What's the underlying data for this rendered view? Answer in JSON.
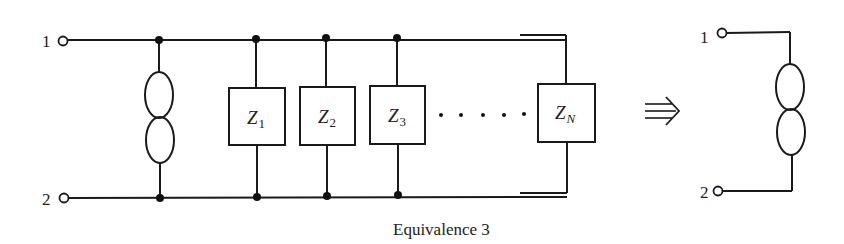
{
  "diagram": {
    "type": "circuit-equivalence",
    "caption": "Equivalence 3",
    "equivalence_arrow": "⇛",
    "left_circuit": {
      "terminals": [
        {
          "label": "1"
        },
        {
          "label": "2"
        }
      ],
      "source_element": "inductor-double-loop-icon",
      "impedances": [
        {
          "symbol": "Z",
          "subscript": "1"
        },
        {
          "symbol": "Z",
          "subscript": "2"
        },
        {
          "symbol": "Z",
          "subscript": "3"
        },
        {
          "symbol": "Z",
          "subscript": "N"
        }
      ],
      "ellipsis": "· · · · ·"
    },
    "right_circuit": {
      "terminals": [
        {
          "label": "1"
        },
        {
          "label": "2"
        }
      ],
      "element": "inductor-double-loop-icon"
    }
  }
}
